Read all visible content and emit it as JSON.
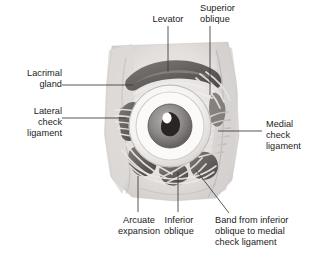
{
  "figure": {
    "background_color": "#ffffff",
    "text_color": "#1b1b1b",
    "leader_color": "#3a3a3a"
  },
  "labels": {
    "levator": "Levator",
    "superior_oblique": "Superior\noblique",
    "lacrimal_gland": "Lacrimal\ngland",
    "lateral_check_ligament": "Lateral\ncheck\nligament",
    "medial_check_ligament": "Medial\ncheck\nligament",
    "arcuate_expansion": "Arcuate\nexpansion",
    "inferior_oblique": "Inferior\noblique",
    "band_inferior_oblique": "Band from inferior\noblique to medial\ncheck ligament"
  },
  "specimen": {
    "name": "orbit-dissection-illustration",
    "tissue_light": "#e8e6e4",
    "tissue_mid": "#cfcccb",
    "tissue_dark": "#9b9795",
    "muscle_dark": "#6c6865",
    "muscle_darker": "#4e4a48",
    "sclera": "#f7f6f5",
    "iris": "#8c8a89",
    "pupil": "#241f1e",
    "highlight": "#ffffff"
  }
}
